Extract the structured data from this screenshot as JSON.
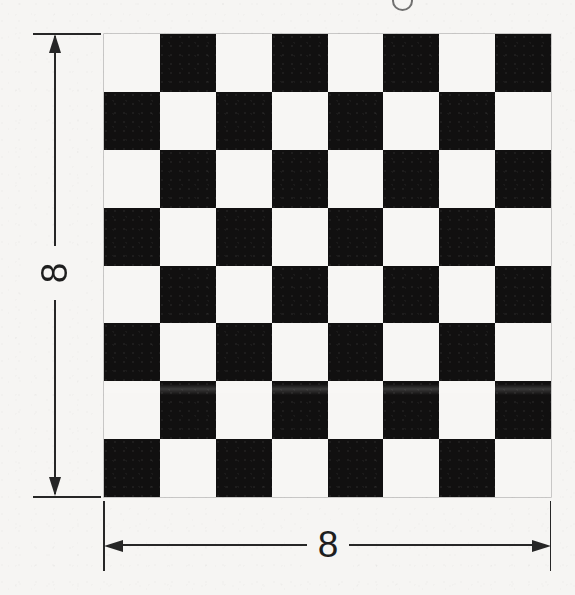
{
  "figure": {
    "type": "technical-drawing",
    "background_color": "#f6f5f3",
    "ink_color": "#262626"
  },
  "board": {
    "rows": 8,
    "columns": 8,
    "top_left_square": "light",
    "light_color": "#f7f6f4",
    "dark_color": "#111010",
    "pattern": [
      [
        "light",
        "dark",
        "light",
        "dark",
        "light",
        "dark",
        "light",
        "dark"
      ],
      [
        "dark",
        "light",
        "dark",
        "light",
        "dark",
        "light",
        "dark",
        "light"
      ],
      [
        "light",
        "dark",
        "light",
        "dark",
        "light",
        "dark",
        "light",
        "dark"
      ],
      [
        "dark",
        "light",
        "dark",
        "light",
        "dark",
        "light",
        "dark",
        "light"
      ],
      [
        "light",
        "dark",
        "light",
        "dark",
        "light",
        "dark",
        "light",
        "dark"
      ],
      [
        "dark",
        "light",
        "dark",
        "light",
        "dark",
        "light",
        "dark",
        "light"
      ],
      [
        "light",
        "dark",
        "light",
        "dark",
        "light",
        "dark",
        "light",
        "dark"
      ],
      [
        "dark",
        "light",
        "dark",
        "light",
        "dark",
        "light",
        "dark",
        "light"
      ]
    ]
  },
  "dimensions": {
    "vertical": {
      "label": "8",
      "orientation": "vertical",
      "arrow_style": "double-headed",
      "placement": "left"
    },
    "horizontal": {
      "label": "8",
      "orientation": "horizontal",
      "arrow_style": "double-headed",
      "placement": "bottom"
    }
  },
  "artifacts": {
    "top_crop_mark": "partial-glyph-cropped-at-top-edge",
    "scan_band": "horizontal-lightening-band-across-row-7"
  }
}
